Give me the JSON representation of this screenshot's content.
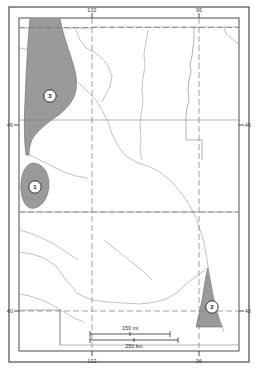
{
  "figure": {
    "kind": "map",
    "title": "",
    "region_description": "Northern Great Plains (North Dakota, South Dakota, Nebraska) with three shaded distribution areas"
  },
  "graticule": {
    "longitude_labels": [
      {
        "text": "102",
        "position": "top-left"
      },
      {
        "text": "96",
        "position": "top-right"
      },
      {
        "text": "102",
        "position": "bottom-left"
      },
      {
        "text": "96",
        "position": "bottom-right"
      }
    ],
    "latitude_labels": [
      {
        "text": "46",
        "position": "left-upper"
      },
      {
        "text": "46",
        "position": "right-upper"
      },
      {
        "text": "40",
        "position": "left-lower"
      },
      {
        "text": "40",
        "position": "right-lower"
      }
    ]
  },
  "markers": [
    {
      "id": "marker-1",
      "label": "1"
    },
    {
      "id": "marker-2",
      "label": "2"
    },
    {
      "id": "marker-3",
      "label": "3"
    }
  ],
  "scale_bar": {
    "miles_label": "150 mi",
    "kilometers_label": "250 km"
  },
  "colors": {
    "shaded_region_fill": "#9a9a9a",
    "shaded_region_stroke": "#6e6e6e",
    "border_line": "#3a3a3a",
    "state_line": "#8a8a8a",
    "river_line": "#9b9b9b",
    "graticule_line": "#7a7a7a",
    "background": "#ffffff",
    "marker_fill": "#ffffff",
    "marker_stroke": "#1a1a1a"
  }
}
